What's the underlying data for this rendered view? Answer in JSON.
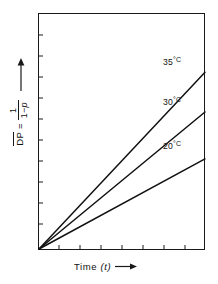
{
  "chart_data": {
    "type": "line",
    "title": "",
    "subtitle": "",
    "xlabel": "Time (t)",
    "ylabel": "DP = 1 / (1 - p)",
    "ylabel_parts": {
      "symbol": "DP",
      "symbol_overbar": true,
      "equals": "=",
      "numerator": "1",
      "denominator": "1 − p"
    },
    "xlabel_parts": {
      "text": "Time",
      "variable": "(t)"
    },
    "x_arrow": "right-arrow",
    "y_arrow": "up-arrow",
    "grid": false,
    "legend_position": "inline-right-of-curves",
    "axis_ticks": {
      "x_tick_count": 8,
      "y_tick_count": 11,
      "tick_direction": "inward",
      "x_tick_labels": [],
      "y_tick_labels": []
    },
    "xlim": [
      0,
      1
    ],
    "ylim": [
      0,
      1
    ],
    "origin_note": "All curves originate at the origin (0, 0)",
    "series": [
      {
        "name": "35 °C",
        "temperature": 35,
        "unit": "°C",
        "x": [
          0,
          1
        ],
        "values": [
          0,
          0.746
        ],
        "slope": 0.746,
        "color": "#111111",
        "style": "solid"
      },
      {
        "name": "30 °C",
        "temperature": 30,
        "unit": "°C",
        "x": [
          0,
          1
        ],
        "values": [
          0,
          0.578
        ],
        "slope": 0.578,
        "color": "#111111",
        "style": "solid"
      },
      {
        "name": "20 °C",
        "temperature": 20,
        "unit": "°C",
        "x": [
          0,
          1
        ],
        "values": [
          0,
          0.38
        ],
        "slope": 0.38,
        "color": "#111111",
        "style": "solid"
      }
    ],
    "colors": {
      "line": "#111111",
      "axis": "#1a1a1a",
      "background": "#ffffff",
      "text": "#111111"
    }
  },
  "labels": {
    "series_35": {
      "value": "35",
      "degree": "°C"
    },
    "series_30": {
      "value": "30",
      "degree": "°C"
    },
    "series_20": {
      "value": "20",
      "degree": "°C"
    },
    "y_symbol": "DP",
    "y_equals": "=",
    "y_numerator": "1",
    "y_den_one": "1",
    "y_den_minus": "−",
    "y_den_p": "p",
    "x_text": "Time",
    "x_var": "(t)"
  },
  "icons": {
    "y_arrow": "up-arrow-icon",
    "x_arrow": "right-arrow-icon"
  }
}
